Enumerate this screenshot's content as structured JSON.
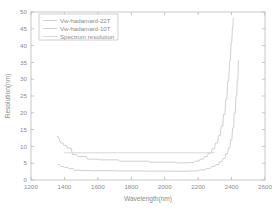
{
  "chart_data": {
    "type": "line",
    "title": "",
    "xlabel": "Wavelength(nm)",
    "ylabel": "Resolution(nm)",
    "xlim": [
      1200,
      2600
    ],
    "ylim": [
      0,
      50
    ],
    "xticks": [
      1200,
      1400,
      1600,
      1800,
      2000,
      2200,
      2400,
      2600
    ],
    "yticks": [
      0,
      5,
      10,
      15,
      20,
      25,
      30,
      35,
      40,
      45,
      50
    ],
    "xtick_labels": [
      "1200",
      "1400",
      "1600",
      "1800",
      "2000",
      "2200",
      "2400",
      "2600"
    ],
    "ytick_labels": [
      "0",
      "5",
      "10",
      "15",
      "20",
      "25",
      "30",
      "35",
      "40",
      "45",
      "50"
    ],
    "grid": false,
    "legend_position": "upper-left",
    "series": [
      {
        "name": "Vw-hadamard-22T",
        "color": "#c8c8c8",
        "style": "step",
        "x": [
          1355,
          1362,
          1378,
          1392,
          1396,
          1412,
          1418,
          1440,
          1448,
          1472,
          1480,
          1530,
          1538,
          1600,
          1610,
          1720,
          1730,
          1900,
          1910,
          2060,
          2070,
          2140,
          2150,
          2175,
          2182,
          2205,
          2212,
          2232,
          2238,
          2255,
          2262,
          2278,
          2284,
          2298,
          2304,
          2316,
          2322,
          2332,
          2338,
          2347,
          2352,
          2360,
          2365,
          2372,
          2377,
          2383,
          2388,
          2393,
          2397,
          2401,
          2405,
          2408,
          2410
        ],
        "y": [
          13.0,
          13.0,
          11.0,
          11.0,
          10.3,
          10.3,
          9.5,
          9.5,
          7.6,
          7.6,
          7.0,
          7.0,
          6.2,
          6.2,
          6.0,
          6.0,
          5.6,
          5.6,
          5.3,
          5.3,
          5.1,
          5.1,
          5.2,
          5.2,
          5.6,
          5.6,
          6.2,
          6.2,
          7.0,
          7.0,
          8.0,
          8.0,
          9.3,
          9.3,
          11.0,
          11.0,
          13.2,
          13.2,
          16.0,
          16.0,
          19.5,
          19.5,
          24.0,
          24.0,
          29.5,
          29.5,
          35.5,
          35.5,
          41.0,
          41.0,
          45.5,
          45.5,
          48.2
        ]
      },
      {
        "name": "Vw-hadamard-10T",
        "color": "#c8c8c8",
        "style": "step",
        "x": [
          1360,
          1368,
          1382,
          1396,
          1402,
          1420,
          1428,
          1452,
          1460,
          1490,
          1498,
          1560,
          1570,
          1700,
          1710,
          1880,
          1890,
          2050,
          2060,
          2145,
          2155,
          2200,
          2210,
          2240,
          2248,
          2272,
          2280,
          2300,
          2306,
          2322,
          2328,
          2342,
          2348,
          2360,
          2366,
          2376,
          2381,
          2390,
          2395,
          2402,
          2406,
          2412,
          2416,
          2422,
          2426,
          2431,
          2434,
          2438,
          2441
        ],
        "y": [
          4.6,
          4.6,
          4.0,
          4.0,
          3.7,
          3.7,
          3.4,
          3.4,
          2.9,
          2.9,
          2.8,
          2.8,
          2.75,
          2.75,
          2.7,
          2.7,
          2.65,
          2.65,
          2.62,
          2.62,
          2.7,
          2.7,
          3.0,
          3.0,
          3.4,
          3.4,
          4.0,
          4.0,
          4.6,
          4.6,
          5.4,
          5.4,
          6.4,
          6.4,
          7.8,
          7.8,
          9.5,
          9.5,
          12.0,
          12.0,
          15.5,
          15.5,
          20.0,
          20.0,
          25.0,
          25.0,
          30.0,
          30.0,
          35.8
        ]
      },
      {
        "name": "Spectrum resolution",
        "color": "#d2d2d2",
        "style": "line",
        "x": [
          1398,
          2300
        ],
        "y": [
          8.1,
          8.1
        ]
      }
    ]
  },
  "legend": {
    "entries": [
      {
        "label": "Vw-hadamard-22T"
      },
      {
        "label": "Vw-hadamard-10T"
      },
      {
        "label": "Spectrum resolution"
      }
    ]
  },
  "axes": {
    "x_title": "Wavelength(nm)",
    "y_title": "Resolution(nm)"
  },
  "colors": {
    "axis": "#b9b9b9",
    "text": "#8c8c8c",
    "series": "#c8c8c8",
    "background": "#ffffff"
  }
}
